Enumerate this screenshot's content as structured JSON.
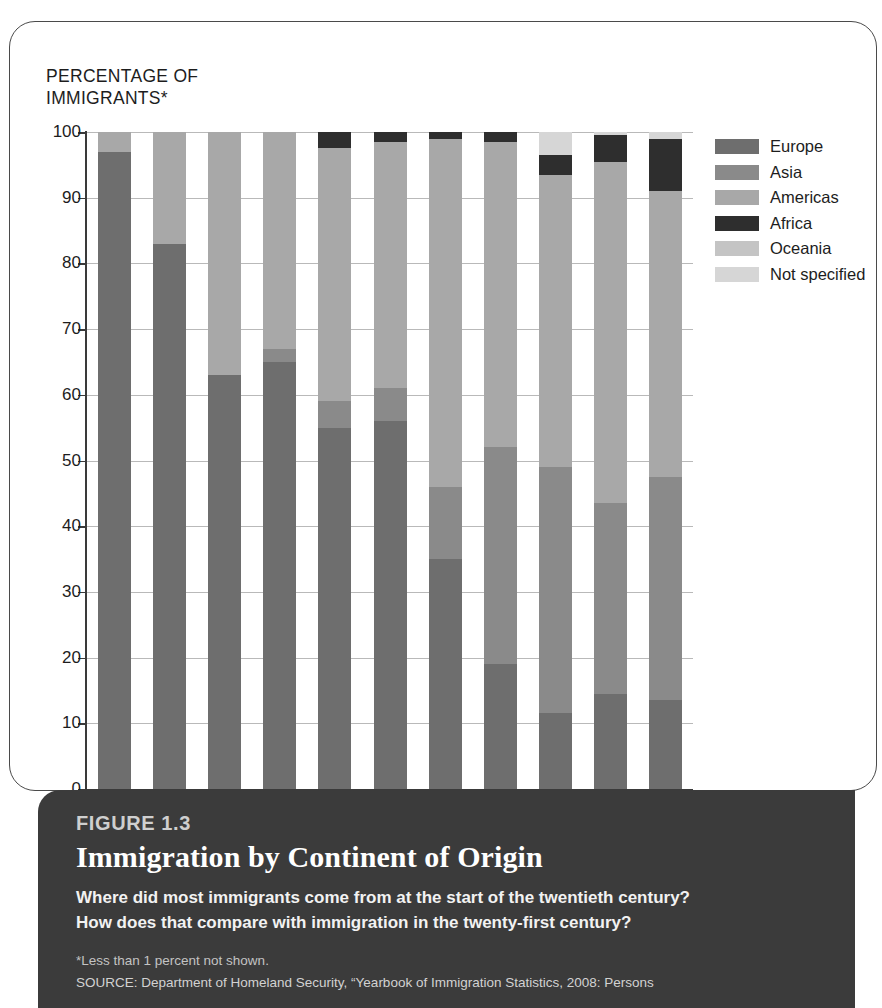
{
  "axis_title": "PERCENTAGE OF\nIMMIGRANTS*",
  "legend": {
    "items": [
      {
        "label": "Europe",
        "color": "#6e6e6e"
      },
      {
        "label": "Asia",
        "color": "#8a8a8a"
      },
      {
        "label": "Americas",
        "color": "#a8a8a8"
      },
      {
        "label": "Africa",
        "color": "#2e2e2e"
      },
      {
        "label": "Oceania",
        "color": "#c4c4c4"
      },
      {
        "label": "Not specified",
        "color": "#d6d6d6"
      }
    ]
  },
  "caption": {
    "figure_number": "FIGURE 1.3",
    "title": "Immigration by Continent of Origin",
    "question": "Where did most immigrants come from at the start of the twentieth century? How does that compare with immigration in the twenty-first century?",
    "footnote": "*Less than 1 percent not shown.",
    "source": "SOURCE: Department of Homeland Security, “Yearbook of Immigration Statistics, 2008: Persons"
  },
  "chart_data": {
    "type": "bar",
    "stacked": true,
    "title": "Immigration by Continent of Origin",
    "xlabel": "",
    "ylabel": "PERCENTAGE OF IMMIGRANTS*",
    "ylim": [
      0,
      100
    ],
    "yticks": [
      0,
      10,
      20,
      30,
      40,
      50,
      60,
      70,
      80,
      90,
      100
    ],
    "grid": true,
    "legend_position": "right",
    "categories": [
      "1900s",
      "1910s",
      "1920s",
      "1930s",
      "1940s",
      "1950s",
      "1960s",
      "1970s",
      "1980s",
      "1990s",
      "2000s"
    ],
    "series": [
      {
        "name": "Europe",
        "color": "#6e6e6e",
        "values": [
          97,
          83,
          63,
          65,
          55,
          56,
          35,
          19,
          11.5,
          14.5,
          13.5
        ]
      },
      {
        "name": "Asia",
        "color": "#8a8a8a",
        "values": [
          0,
          0,
          0,
          2,
          4,
          5,
          11,
          33,
          37.5,
          29,
          34
        ]
      },
      {
        "name": "Americas",
        "color": "#a8a8a8",
        "values": [
          3,
          17,
          37,
          33,
          38.5,
          37.5,
          53,
          46.5,
          44.5,
          52,
          43.5
        ]
      },
      {
        "name": "Africa",
        "color": "#2e2e2e",
        "values": [
          0,
          0,
          0,
          0,
          2.5,
          1.5,
          1,
          1.5,
          3,
          4,
          8
        ]
      },
      {
        "name": "Oceania",
        "color": "#c4c4c4",
        "values": [
          0,
          0,
          0,
          0,
          0,
          0,
          0,
          0,
          0,
          0,
          0
        ]
      },
      {
        "name": "Not specified",
        "color": "#d6d6d6",
        "values": [
          0,
          0,
          0,
          0,
          0,
          0,
          0,
          0,
          3.5,
          0.5,
          1
        ]
      }
    ],
    "cumulative_tops": {
      "1900s": {
        "Europe": 97,
        "Asia": 97,
        "Americas": 100,
        "Africa": 100,
        "Oceania": 100,
        "Not specified": 100
      },
      "1910s": {
        "Europe": 83,
        "Asia": 83,
        "Americas": 100,
        "Africa": 100,
        "Oceania": 100,
        "Not specified": 100
      },
      "1920s": {
        "Europe": 63,
        "Asia": 63,
        "Americas": 100,
        "Africa": 100,
        "Oceania": 100,
        "Not specified": 100
      },
      "1930s": {
        "Europe": 65,
        "Asia": 67,
        "Americas": 100,
        "Africa": 100,
        "Oceania": 100,
        "Not specified": 100
      },
      "1940s": {
        "Europe": 55,
        "Asia": 59,
        "Americas": 97.5,
        "Africa": 100,
        "Oceania": 100,
        "Not specified": 100
      },
      "1950s": {
        "Europe": 56,
        "Asia": 61,
        "Americas": 98.5,
        "Africa": 100,
        "Oceania": 100,
        "Not specified": 100
      },
      "1960s": {
        "Europe": 35,
        "Asia": 46,
        "Americas": 99,
        "Africa": 100,
        "Oceania": 100,
        "Not specified": 100
      },
      "1970s": {
        "Europe": 19,
        "Asia": 52,
        "Americas": 98.5,
        "Africa": 100,
        "Oceania": 100,
        "Not specified": 100
      },
      "1980s": {
        "Europe": 11.5,
        "Asia": 49,
        "Americas": 93.5,
        "Africa": 96.5,
        "Oceania": 96.5,
        "Not specified": 100
      },
      "1990s": {
        "Europe": 14.5,
        "Asia": 43.5,
        "Americas": 95.5,
        "Africa": 99.5,
        "Oceania": 99.5,
        "Not specified": 100
      },
      "2000s": {
        "Europe": 13.5,
        "Asia": 47.5,
        "Americas": 91,
        "Africa": 99,
        "Oceania": 99,
        "Not specified": 100
      }
    }
  }
}
